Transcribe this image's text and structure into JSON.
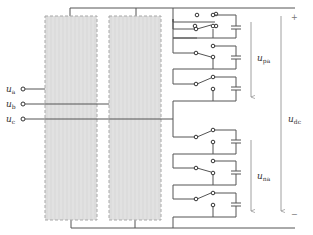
{
  "diagram": {
    "type": "circuit-schematic",
    "inputs": [
      {
        "id": "ua",
        "label": "u",
        "sub": "a",
        "y": 89
      },
      {
        "id": "ub",
        "label": "u",
        "sub": "b",
        "y": 104
      },
      {
        "id": "uc",
        "label": "u",
        "sub": "c",
        "y": 119
      }
    ],
    "modules": [
      {
        "id": "block-1",
        "x": 45,
        "y": 16,
        "w": 52,
        "h": 204
      },
      {
        "id": "block-2",
        "x": 109,
        "y": 16,
        "w": 52,
        "h": 204
      }
    ],
    "submodules_upper": 3,
    "submodules_lower": 3,
    "voltage_labels": {
      "upper_arm": {
        "label": "u",
        "sub": "pa"
      },
      "lower_arm": {
        "label": "u",
        "sub": "na"
      },
      "dc_link": {
        "label": "u",
        "sub": "dc"
      }
    },
    "polarity": {
      "plus": "+",
      "minus": "−"
    },
    "colors": {
      "line": "#555555",
      "block_fill": "#d9d9d9",
      "block_border": "#a8a8a8",
      "label": "#333333"
    }
  }
}
